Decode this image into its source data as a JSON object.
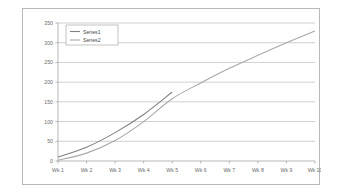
{
  "chart_data": {
    "type": "line",
    "title": "",
    "xlabel": "",
    "ylabel": "",
    "grid": true,
    "legend_position": "top-left",
    "ylim": [
      0,
      350
    ],
    "yticks": [
      0,
      50,
      100,
      150,
      200,
      250,
      300,
      350
    ],
    "ytick_labels": [
      "0",
      "50",
      "100",
      "150",
      "200",
      "250",
      "300",
      "350"
    ],
    "categories": [
      "Wk 1",
      "Wk 2",
      "Wk 3",
      "Wk 4",
      "Wk 5",
      "Wk 6",
      "Wk 7",
      "Wk 8",
      "Wk 9",
      "Wk 10"
    ],
    "series": [
      {
        "name": "Series1",
        "color": "#808080",
        "values": [
          10,
          35,
          72,
          118,
          175,
          null,
          null,
          null,
          null,
          null
        ]
      },
      {
        "name": "Series2",
        "color": "#a8a8a8",
        "values": [
          2,
          20,
          52,
          100,
          158,
          198,
          235,
          268,
          300,
          330
        ]
      }
    ]
  },
  "legend": {
    "entries": [
      {
        "label": "Series1"
      },
      {
        "label": "Series2"
      }
    ]
  },
  "colors": {
    "frame_border": "#b8b8b8",
    "gridline": "#b0b0b0",
    "axis": "#9a9a9a",
    "tick_text": "#6b6b6b",
    "background": "#ffffff"
  }
}
